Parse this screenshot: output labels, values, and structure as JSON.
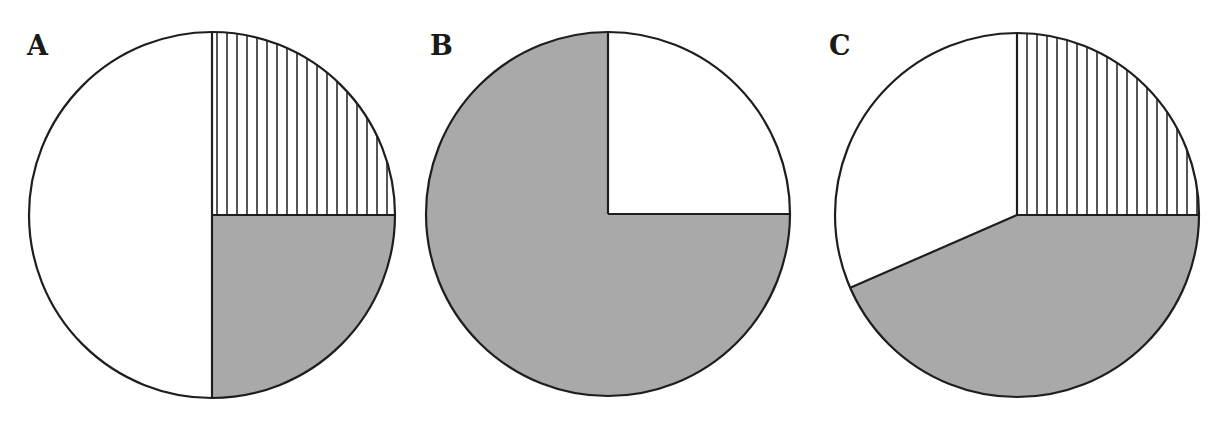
{
  "chart_data": [
    {
      "type": "pie",
      "title": "A",
      "slices": [
        {
          "label": "hatched",
          "pattern": "vertical-hatch",
          "value": 25,
          "start_deg": 0,
          "end_deg": 90
        },
        {
          "label": "gray",
          "pattern": "solid-gray",
          "value": 25,
          "start_deg": 90,
          "end_deg": 180
        },
        {
          "label": "white",
          "pattern": "white",
          "value": 50,
          "start_deg": 180,
          "end_deg": 360
        }
      ],
      "center": [
        212,
        215
      ],
      "radius": 183
    },
    {
      "type": "pie",
      "title": "B",
      "slices": [
        {
          "label": "white",
          "pattern": "white",
          "value": 25,
          "start_deg": 0,
          "end_deg": 90
        },
        {
          "label": "gray",
          "pattern": "solid-gray",
          "value": 75,
          "start_deg": 90,
          "end_deg": 360
        }
      ],
      "center": [
        608,
        214
      ],
      "radius": 182
    },
    {
      "type": "pie",
      "title": "C",
      "slices": [
        {
          "label": "hatched",
          "pattern": "vertical-hatch",
          "value": 25,
          "start_deg": 0,
          "end_deg": 90
        },
        {
          "label": "gray",
          "pattern": "solid-gray",
          "value": 43.5,
          "start_deg": 90,
          "end_deg": 246.4
        },
        {
          "label": "white",
          "pattern": "white",
          "value": 31.5,
          "start_deg": 246.4,
          "end_deg": 360
        }
      ],
      "center": [
        1017,
        215
      ],
      "radius": 182
    }
  ],
  "labels": {
    "a": "A",
    "b": "B",
    "c": "C"
  },
  "colors": {
    "gray": "#a9a9a9",
    "white": "#ffffff",
    "stroke": "#1e1e1e",
    "hatch": "#2a2a2a"
  }
}
